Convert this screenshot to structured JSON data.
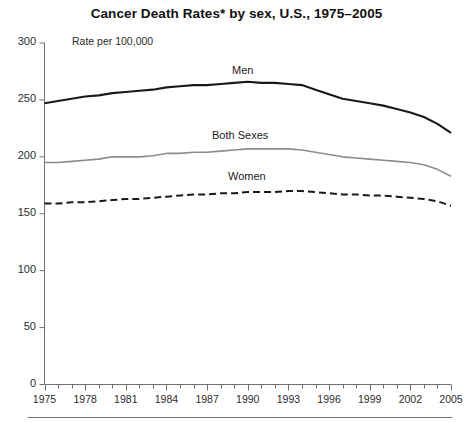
{
  "chart_data": {
    "type": "line",
    "title": "Cancer Death Rates* by sex, U.S., 1975–2005",
    "annotation": "Rate per 100,000",
    "xlabel": "",
    "ylabel": "",
    "ylim": [
      0,
      300
    ],
    "xlim": [
      1975,
      2005
    ],
    "yticks": [
      0,
      50,
      100,
      150,
      200,
      250,
      300
    ],
    "xticks": [
      1975,
      1978,
      1981,
      1984,
      1987,
      1990,
      1993,
      1996,
      1999,
      2002,
      2005
    ],
    "xtick_minor_step": 1,
    "grid": false,
    "legend_position": "inline-labels",
    "x": [
      1975,
      1976,
      1977,
      1978,
      1979,
      1980,
      1981,
      1982,
      1983,
      1984,
      1985,
      1986,
      1987,
      1988,
      1989,
      1990,
      1991,
      1992,
      1993,
      1994,
      1995,
      1996,
      1997,
      1998,
      1999,
      2000,
      2001,
      2002,
      2003,
      2004,
      2005
    ],
    "series": [
      {
        "name": "Men",
        "label": "Men",
        "color": "#1a1a1a",
        "style": "solid",
        "width": 2.1,
        "values": [
          247,
          249,
          251,
          253,
          254,
          256,
          257,
          258,
          259,
          261,
          262,
          263,
          263,
          264,
          265,
          266,
          265,
          265,
          264,
          263,
          259,
          255,
          251,
          249,
          247,
          245,
          242,
          239,
          235,
          229,
          221
        ]
      },
      {
        "name": "Both Sexes",
        "label": "Both Sexes",
        "color": "#8c8c8c",
        "style": "solid",
        "width": 1.6,
        "values": [
          195,
          195,
          196,
          197,
          198,
          200,
          200,
          200,
          201,
          203,
          203,
          204,
          204,
          205,
          206,
          207,
          207,
          207,
          207,
          206,
          204,
          202,
          200,
          199,
          198,
          197,
          196,
          195,
          193,
          189,
          183
        ]
      },
      {
        "name": "Women",
        "label": "Women",
        "color": "#1a1a1a",
        "style": "dashed",
        "width": 2.0,
        "values": [
          159,
          159,
          160,
          160,
          161,
          162,
          163,
          163,
          164,
          165,
          166,
          167,
          167,
          168,
          168,
          169,
          169,
          169,
          170,
          170,
          169,
          168,
          167,
          167,
          166,
          166,
          165,
          164,
          163,
          161,
          157
        ]
      }
    ]
  },
  "footer": {
    "has_rule": true
  }
}
